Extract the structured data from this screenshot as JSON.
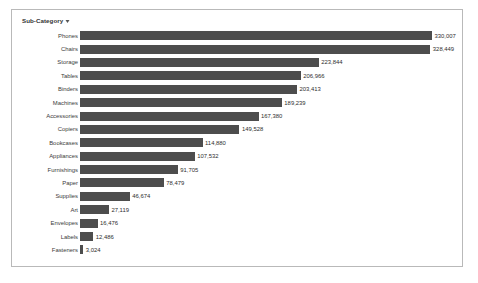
{
  "header": {
    "title": "Sub-Category",
    "sort_icon": "sort-descending-icon"
  },
  "colors": {
    "bar": "#4d4d4d",
    "frame_border": "#b9b9b9",
    "label_text": "#3b3b3b",
    "value_text": "#2e2e2e",
    "background": "#ffffff"
  },
  "chart_data": {
    "type": "bar",
    "orientation": "horizontal",
    "title": "Sub-Category",
    "xlabel": "",
    "ylabel": "Sub-Category",
    "grid": false,
    "legend": "none",
    "xlim": [
      0,
      330007
    ],
    "categories": [
      "Phones",
      "Chairs",
      "Storage",
      "Tables",
      "Binders",
      "Machines",
      "Accessories",
      "Copiers",
      "Bookcases",
      "Appliances",
      "Furnishings",
      "Paper",
      "Supplies",
      "Art",
      "Envelopes",
      "Labels",
      "Fasteners"
    ],
    "values": [
      330007,
      328449,
      223844,
      206966,
      203413,
      189239,
      167380,
      149528,
      114880,
      107532,
      91705,
      78479,
      46674,
      27119,
      16476,
      12486,
      3024
    ],
    "value_labels": [
      "330,007",
      "328,449",
      "223,844",
      "206,966",
      "203,413",
      "189,239",
      "167,380",
      "149,528",
      "114,880",
      "107,532",
      "91,705",
      "78,479",
      "46,674",
      "27,119",
      "16,476",
      "12,486",
      "3,024"
    ]
  }
}
